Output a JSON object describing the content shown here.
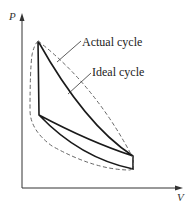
{
  "diagram": {
    "type": "P-V diagram",
    "axes": {
      "y_label": "P",
      "x_label": "V"
    },
    "labels": {
      "actual": "Actual cycle",
      "ideal": "Ideal cycle"
    },
    "colors": {
      "ideal_line": "#1a1a1a",
      "actual_line": "#666666",
      "axis": "#333333"
    }
  }
}
